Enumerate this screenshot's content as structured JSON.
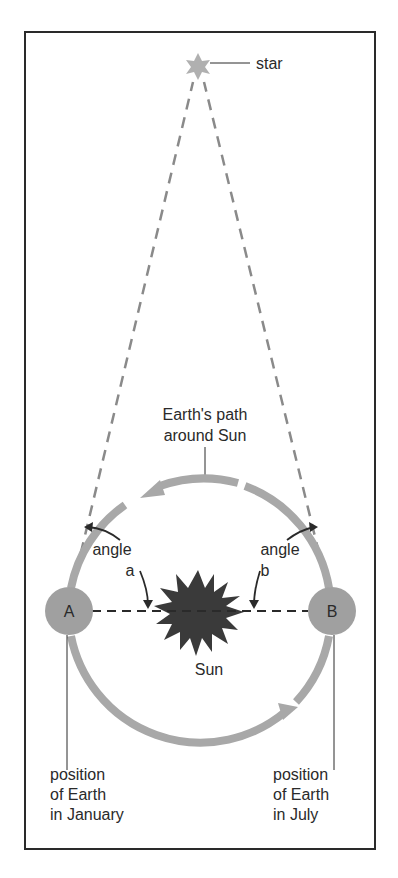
{
  "diagram": {
    "star_label": "star",
    "orbit_label_line1": "Earth's path",
    "orbit_label_line2": "around Sun",
    "angle_a_line1": "angle",
    "angle_a_line2": "a",
    "angle_b_line1": "angle",
    "angle_b_line2": "b",
    "point_a": "A",
    "point_b": "B",
    "sun_label": "Sun",
    "january_line1": "position",
    "january_line2": "of Earth",
    "january_line3": "in January",
    "july_line1": "position",
    "july_line2": "of Earth",
    "july_line3": "in July"
  },
  "colors": {
    "frame": "#2a2a2a",
    "orbit": "#a8a8a8",
    "earth": "#a0a0a0",
    "sun": "#3a3a3a",
    "star": "#b0b0b0",
    "sightline": "#8a8a8a",
    "text": "#2a2a2a"
  }
}
